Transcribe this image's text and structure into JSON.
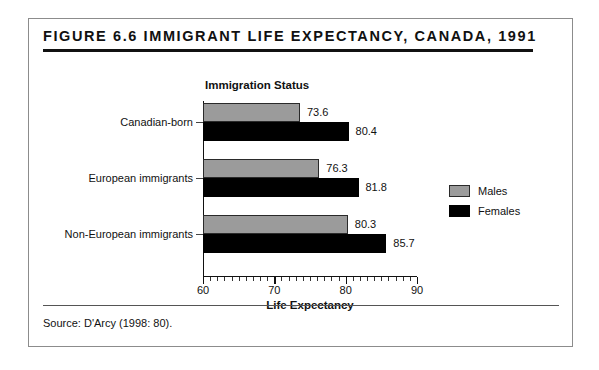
{
  "figure": {
    "title": "Figure 6.6  Immigrant Life Expectancy, Canada, 1991",
    "source": "Source:  D'Arcy (1998: 80)."
  },
  "legend": {
    "position": "right",
    "entries": [
      {
        "label": "Males",
        "color": "#9b9b9b"
      },
      {
        "label": "Females",
        "color": "#000000"
      }
    ]
  },
  "chart_data": {
    "type": "bar",
    "orientation": "horizontal",
    "title": "Figure 6.6  Immigrant Life Expectancy, Canada, 1991",
    "xlabel": "Life Expectancy",
    "ylabel": "Immigration Status",
    "xlim": [
      60,
      90
    ],
    "xticks": [
      60,
      70,
      80,
      90
    ],
    "xtick_labels": [
      "60",
      "70",
      "80",
      "90"
    ],
    "minor_tick_step": 1,
    "grid": false,
    "categories": [
      "Canadian-born",
      "European immigrants",
      "Non-European immigrants"
    ],
    "series": [
      {
        "name": "Males",
        "color": "#9b9b9b",
        "values": [
          73.6,
          76.3,
          80.3
        ]
      },
      {
        "name": "Females",
        "color": "#000000",
        "values": [
          80.4,
          81.8,
          85.7
        ]
      }
    ],
    "data_labels": [
      [
        "73.6",
        "80.4"
      ],
      [
        "76.3",
        "81.8"
      ],
      [
        "80.3",
        "85.7"
      ]
    ]
  }
}
